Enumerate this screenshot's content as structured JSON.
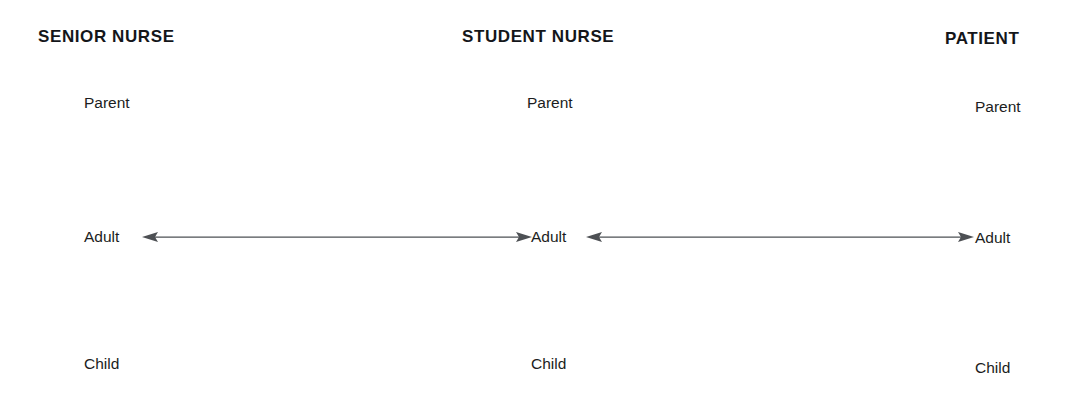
{
  "diagram": {
    "background_color": "#ffffff",
    "text_color": "#1b1d21",
    "header_color": "#14161a",
    "arrow_color": "#4d5054"
  },
  "columns": [
    {
      "key": "senior-nurse",
      "header": "SENIOR NURSE",
      "states": {
        "parent": "Parent",
        "adult": "Adult",
        "child": "Child"
      }
    },
    {
      "key": "student-nurse",
      "header": "STUDENT NURSE",
      "states": {
        "parent": "Parent",
        "adult": "Adult",
        "child": "Child"
      }
    },
    {
      "key": "patient",
      "header": "PATIENT",
      "states": {
        "parent": "Parent",
        "adult": "Adult",
        "child": "Child"
      }
    }
  ],
  "connections": [
    {
      "key": "senior-student-adult-link",
      "from": "SENIOR NURSE",
      "to": "STUDENT NURSE",
      "from_state": "Adult",
      "to_state": "Adult",
      "style": "double-headed-arrow"
    },
    {
      "key": "student-patient-adult-link",
      "from": "STUDENT NURSE",
      "to": "PATIENT",
      "from_state": "Adult",
      "to_state": "Adult",
      "style": "double-headed-arrow"
    }
  ]
}
